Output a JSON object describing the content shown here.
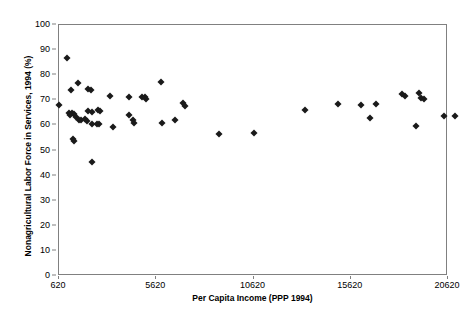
{
  "chart_data": {
    "type": "scatter",
    "title": "",
    "xlabel": "Per Capita Income (PPP 1994)",
    "ylabel": "Nonagricultural Labor Force in Services, 1994 (%)",
    "xlim": [
      620,
      20620
    ],
    "ylim": [
      0,
      100
    ],
    "xticks": [
      620,
      5620,
      10620,
      15620,
      20620
    ],
    "xtick_labels": [
      "620",
      "5620",
      "10620",
      "15620",
      "20620"
    ],
    "yticks": [
      0,
      10,
      20,
      30,
      40,
      50,
      60,
      70,
      80,
      90,
      100
    ],
    "ytick_labels": [
      "0",
      "10",
      "20",
      "30",
      "40",
      "50",
      "60",
      "70",
      "80",
      "90",
      "100"
    ],
    "grid": false,
    "legend": false,
    "marker": "diamond",
    "marker_color": "#1a1a1a",
    "points": [
      {
        "x": 620,
        "y": 68.0
      },
      {
        "x": 1030,
        "y": 87.0
      },
      {
        "x": 1230,
        "y": 74.3
      },
      {
        "x": 1590,
        "y": 77.0
      },
      {
        "x": 1130,
        "y": 65.0
      },
      {
        "x": 1290,
        "y": 64.8
      },
      {
        "x": 1390,
        "y": 64.6
      },
      {
        "x": 1180,
        "y": 64.3
      },
      {
        "x": 1490,
        "y": 63.4
      },
      {
        "x": 1640,
        "y": 62.2
      },
      {
        "x": 1750,
        "y": 62.0
      },
      {
        "x": 1340,
        "y": 54.4
      },
      {
        "x": 1390,
        "y": 53.6
      },
      {
        "x": 2100,
        "y": 74.4
      },
      {
        "x": 2260,
        "y": 74.3
      },
      {
        "x": 2110,
        "y": 65.8
      },
      {
        "x": 2310,
        "y": 65.2
      },
      {
        "x": 1960,
        "y": 62.6
      },
      {
        "x": 2060,
        "y": 61.8
      },
      {
        "x": 2310,
        "y": 60.4
      },
      {
        "x": 2620,
        "y": 66.3
      },
      {
        "x": 2720,
        "y": 65.9
      },
      {
        "x": 2570,
        "y": 60.6
      },
      {
        "x": 2700,
        "y": 60.5
      },
      {
        "x": 2320,
        "y": 45.4
      },
      {
        "x": 3260,
        "y": 71.6
      },
      {
        "x": 3400,
        "y": 59.2
      },
      {
        "x": 4230,
        "y": 71.2
      },
      {
        "x": 4240,
        "y": 64.0
      },
      {
        "x": 4450,
        "y": 62.2
      },
      {
        "x": 4480,
        "y": 61.0
      },
      {
        "x": 4900,
        "y": 71.3
      },
      {
        "x": 5060,
        "y": 71.4
      },
      {
        "x": 5080,
        "y": 70.6
      },
      {
        "x": 5840,
        "y": 77.4
      },
      {
        "x": 5930,
        "y": 61.0
      },
      {
        "x": 6600,
        "y": 62.2
      },
      {
        "x": 7000,
        "y": 68.8
      },
      {
        "x": 7080,
        "y": 67.6
      },
      {
        "x": 8830,
        "y": 56.4
      },
      {
        "x": 10650,
        "y": 57.0
      },
      {
        "x": 13250,
        "y": 66.2
      },
      {
        "x": 14950,
        "y": 68.6
      },
      {
        "x": 16150,
        "y": 68.0
      },
      {
        "x": 16900,
        "y": 68.4
      },
      {
        "x": 16600,
        "y": 63.0
      },
      {
        "x": 18250,
        "y": 72.6
      },
      {
        "x": 18400,
        "y": 71.8
      },
      {
        "x": 19150,
        "y": 73.0
      },
      {
        "x": 19250,
        "y": 71.0
      },
      {
        "x": 19400,
        "y": 70.4
      },
      {
        "x": 19000,
        "y": 59.8
      },
      {
        "x": 20400,
        "y": 63.6
      },
      {
        "x": 21000,
        "y": 63.8
      }
    ]
  }
}
